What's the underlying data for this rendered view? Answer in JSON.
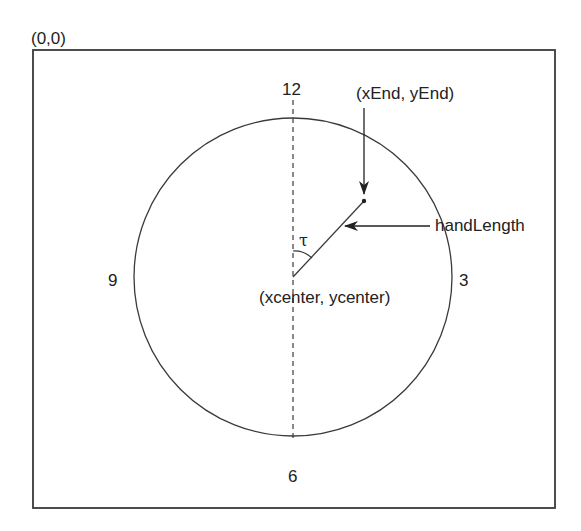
{
  "origin_label": "(0,0)",
  "clock_numbers": {
    "twelve": "12",
    "three": "3",
    "six": "6",
    "nine": "9"
  },
  "labels": {
    "end_point": "(xEnd, yEnd)",
    "hand_length": "handLength",
    "center": "(xcenter, ycenter)",
    "angle": "τ"
  },
  "geometry": {
    "frame": {
      "x": 33,
      "y": 50,
      "width": 522,
      "height": 458
    },
    "circle": {
      "cx": 293,
      "cy": 277,
      "r": 159
    },
    "hand": {
      "x1": 293,
      "y1": 277,
      "x2": 364,
      "y2": 201
    },
    "dashed_axis": {
      "x": 293,
      "y1": 100,
      "y2": 438
    }
  },
  "colors": {
    "stroke": "#3a3a3a",
    "text": "#222222",
    "background": "#ffffff"
  }
}
